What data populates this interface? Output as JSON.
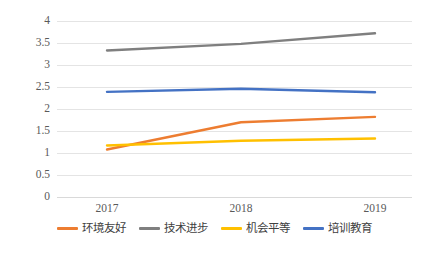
{
  "chart_data": {
    "type": "line",
    "title": "",
    "xlabel": "",
    "ylabel": "",
    "categories": [
      "2017",
      "2018",
      "2019"
    ],
    "ylim": [
      0,
      4
    ],
    "ytick_step": 0.5,
    "yticks": [
      "4",
      "3.5",
      "3",
      "2.5",
      "2",
      "1.5",
      "1",
      "0.5",
      "0"
    ],
    "grid": true,
    "legend_position": "bottom",
    "series": [
      {
        "name": "环境友好",
        "color": "#ED7D31",
        "values": [
          1.08,
          1.7,
          1.82
        ]
      },
      {
        "name": "技术进步",
        "color": "#7F7F7F",
        "values": [
          3.33,
          3.48,
          3.72
        ]
      },
      {
        "name": "机会平等",
        "color": "#FFC000",
        "values": [
          1.17,
          1.28,
          1.33
        ]
      },
      {
        "name": "培训教育",
        "color": "#4472C4",
        "values": [
          2.39,
          2.46,
          2.38
        ]
      }
    ]
  },
  "axis": {
    "y_ticks": [
      {
        "label": "4",
        "value": 4
      },
      {
        "label": "3.5",
        "value": 3.5
      },
      {
        "label": "3",
        "value": 3
      },
      {
        "label": "2.5",
        "value": 2.5
      },
      {
        "label": "2",
        "value": 2
      },
      {
        "label": "1.5",
        "value": 1.5
      },
      {
        "label": "1",
        "value": 1
      },
      {
        "label": "0.5",
        "value": 0.5
      },
      {
        "label": "0",
        "value": 0
      }
    ],
    "x_ticks": [
      {
        "label": "2017"
      },
      {
        "label": "2018"
      },
      {
        "label": "2019"
      }
    ]
  },
  "legend": {
    "items": [
      {
        "label": "环境友好",
        "color": "#ED7D31"
      },
      {
        "label": "技术进步",
        "color": "#7F7F7F"
      },
      {
        "label": "机会平等",
        "color": "#FFC000"
      },
      {
        "label": "培训教育",
        "color": "#4472C4"
      }
    ]
  }
}
